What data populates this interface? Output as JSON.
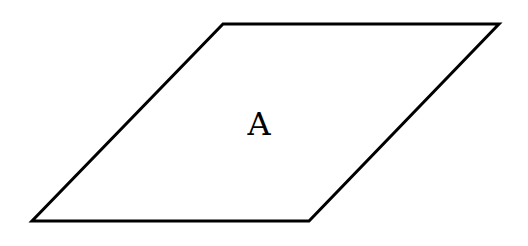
{
  "diagram": {
    "shape": "parallelogram",
    "label": "A",
    "stroke_color": "#000000",
    "fill_color": "#ffffff"
  }
}
